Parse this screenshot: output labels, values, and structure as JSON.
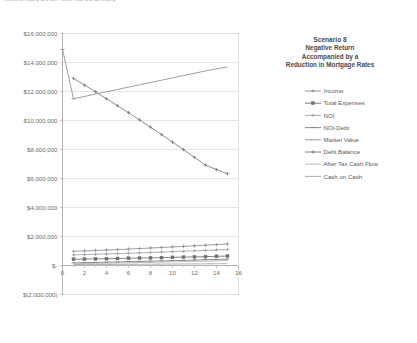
{
  "header": {
    "clipped_text": "Return on Equity and Net ‑ Cash Flow and Net Equity"
  },
  "legend": {
    "title": "Scenario 8",
    "subtitle_lines": [
      "Negative Return",
      "Accompanied by a",
      "Reduction in Mortgage Rates"
    ],
    "items": [
      {
        "label": "Income",
        "color": "#8a8f96",
        "marker": "plus"
      },
      {
        "label": "Total Expenses",
        "color": "#6e6e6e",
        "marker": "square"
      },
      {
        "label": "NOI",
        "color": "#9aa0a6",
        "marker": "plus"
      },
      {
        "label": "NOI-Debt",
        "color": "#7d7d7d",
        "marker": "dash"
      },
      {
        "label": "Market Value",
        "color": "#8c8c8c",
        "marker": "none"
      },
      {
        "label": "Debt Balance",
        "color": "#787878",
        "marker": "plus"
      },
      {
        "label": "After Tax Cash Flow",
        "color": "#b0b0b0",
        "marker": "none"
      },
      {
        "label": "Cash on Cash",
        "color": "#a4a4a4",
        "marker": "none"
      }
    ]
  },
  "chart_data": {
    "type": "line",
    "title": "Scenario 8",
    "subtitle": "Negative Return Accompanied by a Reduction in Mortgage Rates",
    "xlabel": "",
    "ylabel": "",
    "grid": true,
    "legend_position": "right",
    "xlim": [
      0,
      16
    ],
    "ylim": [
      -2000000,
      16000000
    ],
    "xticks": [
      0,
      2,
      4,
      6,
      8,
      10,
      12,
      14,
      16
    ],
    "yticks": [
      16000000,
      14000000,
      12000000,
      10000000,
      8000000,
      6000000,
      4000000,
      2000000,
      0,
      -2000000
    ],
    "ytick_labels": [
      "$16,000,000",
      "$14,000,000",
      "$12,000,000",
      "$10,000,000",
      "$8,000,000",
      "$6,000,000",
      "$4,000,000",
      "$2,000,000",
      "$-",
      "$(2,000,000)"
    ],
    "xtick_labels": [
      "0",
      "2",
      "4",
      "6",
      "8",
      "10",
      "12",
      "14",
      "16"
    ],
    "x": [
      1,
      2,
      3,
      4,
      5,
      6,
      7,
      8,
      9,
      10,
      11,
      12,
      13,
      14,
      15
    ],
    "series": [
      {
        "name": "Income",
        "color": "#8a8f96",
        "marker": "plus",
        "values": [
          980000,
          1010000,
          1040000,
          1070000,
          1100000,
          1135000,
          1170000,
          1205000,
          1240000,
          1280000,
          1320000,
          1360000,
          1400000,
          1440000,
          1485000
        ]
      },
      {
        "name": "Total Expenses",
        "color": "#6e6e6e",
        "marker": "square",
        "values": [
          430000,
          443000,
          456000,
          470000,
          484000,
          498000,
          513000,
          529000,
          545000,
          561000,
          578000,
          595000,
          613000,
          632000,
          651000
        ]
      },
      {
        "name": "NOI",
        "color": "#9aa0a6",
        "marker": "plus",
        "values": [
          730000,
          752000,
          775000,
          798000,
          822000,
          847000,
          872000,
          898000,
          925000,
          953000,
          981000,
          1011000,
          1041000,
          1072000,
          1105000
        ]
      },
      {
        "name": "NOI-Debt",
        "color": "#7d7d7d",
        "marker": "dash",
        "values": [
          180000,
          196000,
          212000,
          228000,
          245000,
          262000,
          280000,
          298000,
          317000,
          336000,
          356000,
          376000,
          397000,
          418000,
          440000
        ]
      },
      {
        "name": "Market Value",
        "color": "#8c8c8c",
        "marker": "none",
        "values": [
          11500000,
          11660000,
          11820000,
          11980000,
          12140000,
          12300000,
          12460000,
          12620000,
          12780000,
          12940000,
          13100000,
          13260000,
          13420000,
          13560000,
          13700000
        ]
      },
      {
        "name": "Debt Balance",
        "color": "#787878",
        "marker": "plus",
        "values": [
          12900000,
          12440000,
          11980000,
          11500000,
          11020000,
          10540000,
          10040000,
          9540000,
          9030000,
          8510000,
          7990000,
          7460000,
          6920000,
          6620000,
          6330000
        ]
      },
      {
        "name": "After Tax Cash Flow",
        "color": "#b0b0b0",
        "marker": "none",
        "values": [
          120000,
          133000,
          146000,
          160000,
          174000,
          188000,
          203000,
          218000,
          234000,
          250000,
          267000,
          284000,
          302000,
          320000,
          339000
        ]
      },
      {
        "name": "Cash on Cash",
        "color": "#a4a4a4",
        "marker": "none",
        "values": [
          60000,
          64000,
          68000,
          72000,
          76000,
          80000,
          85000,
          90000,
          95000,
          100000,
          105000,
          110000,
          116000,
          122000,
          128000
        ]
      }
    ],
    "spike_series": {
      "name": "Market Value initial drop",
      "color": "#8c8c8c",
      "points": [
        [
          0,
          14900000
        ],
        [
          1,
          11500000
        ]
      ]
    }
  }
}
